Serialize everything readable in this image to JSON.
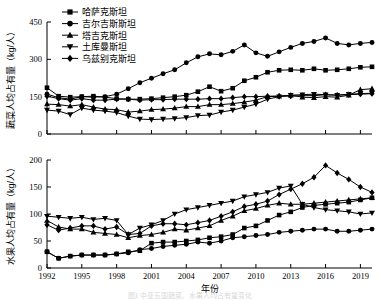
{
  "figure": {
    "caption": "图1  中亚五国蔬菜、水果人均占有量变化"
  },
  "legend": {
    "position": "top-left-inside",
    "items": [
      {
        "label": "哈萨克斯坦",
        "marker": "square"
      },
      {
        "label": "吉尔吉斯斯坦",
        "marker": "circle"
      },
      {
        "label": "塔吉克斯坦",
        "marker": "triangle-up"
      },
      {
        "label": "土库曼斯坦",
        "marker": "triangle-down"
      },
      {
        "label": "乌兹别克斯坦",
        "marker": "diamond"
      }
    ]
  },
  "chart_data": [
    {
      "type": "line",
      "panel": "top",
      "title": "",
      "xlabel": "",
      "ylabel": "蔬菜人均占有量（kg/人）",
      "xlim": [
        1992,
        2020
      ],
      "ylim": [
        0,
        450
      ],
      "yticks": [
        0,
        150,
        300,
        450
      ],
      "xticks": [
        1992,
        1995,
        1998,
        2001,
        2004,
        2007,
        2010,
        2013,
        2016,
        2019
      ],
      "xticklabels": [
        "",
        "",
        "",
        "",
        "",
        "",
        "",
        "",
        "",
        ""
      ],
      "grid": false,
      "x": [
        1992,
        1993,
        1994,
        1995,
        1996,
        1997,
        1998,
        1999,
        2000,
        2001,
        2002,
        2003,
        2004,
        2005,
        2006,
        2007,
        2008,
        2009,
        2010,
        2011,
        2012,
        2013,
        2014,
        2015,
        2016,
        2017,
        2018,
        2019,
        2020
      ],
      "series": [
        {
          "name": "哈萨克斯坦",
          "marker": "square",
          "values": [
            186,
            152,
            148,
            150,
            152,
            148,
            142,
            140,
            140,
            142,
            146,
            150,
            156,
            170,
            190,
            172,
            184,
            214,
            228,
            248,
            256,
            258,
            256,
            262,
            256,
            258,
            262,
            268,
            270
          ]
        },
        {
          "name": "吉尔吉斯斯坦",
          "marker": "circle",
          "values": [
            160,
            146,
            140,
            150,
            148,
            150,
            160,
            182,
            206,
            224,
            242,
            258,
            286,
            310,
            322,
            318,
            332,
            358,
            326,
            312,
            330,
            348,
            364,
            372,
            386,
            364,
            358,
            364,
            368
          ]
        },
        {
          "name": "塔吉克斯坦",
          "marker": "triangle-up",
          "values": [
            120,
            118,
            112,
            118,
            108,
            100,
            98,
            88,
            92,
            98,
            100,
            104,
            110,
            110,
            118,
            118,
            122,
            128,
            136,
            150,
            152,
            156,
            148,
            146,
            150,
            148,
            156,
            178,
            182
          ]
        },
        {
          "name": "土库曼斯坦",
          "marker": "triangle-down",
          "values": [
            96,
            92,
            78,
            104,
            96,
            92,
            86,
            72,
            60,
            58,
            60,
            62,
            66,
            74,
            76,
            88,
            96,
            108,
            120,
            140,
            150,
            156,
            158,
            160,
            158,
            156,
            160,
            162,
            164
          ]
        },
        {
          "name": "乌兹别克斯坦",
          "marker": "diamond",
          "values": [
            152,
            142,
            136,
            142,
            136,
            136,
            140,
            140,
            136,
            138,
            138,
            140,
            140,
            140,
            142,
            142,
            146,
            150,
            150,
            152,
            152,
            152,
            154,
            154,
            158,
            156,
            158,
            160,
            162
          ]
        }
      ]
    },
    {
      "type": "line",
      "panel": "bottom",
      "title": "",
      "xlabel": "年份",
      "ylabel": "水果人均占有量（kg/人）",
      "xlim": [
        1992,
        2020
      ],
      "ylim": [
        0,
        200
      ],
      "yticks": [
        0,
        50,
        100,
        150,
        200
      ],
      "xticks": [
        1992,
        1995,
        1998,
        2001,
        2004,
        2007,
        2010,
        2013,
        2016,
        2019
      ],
      "xticklabels": [
        "1992",
        "1995",
        "1998",
        "2001",
        "2004",
        "2007",
        "2010",
        "2013",
        "2016",
        "2019"
      ],
      "grid": false,
      "x": [
        1992,
        1993,
        1994,
        1995,
        1996,
        1997,
        1998,
        1999,
        2000,
        2001,
        2002,
        2003,
        2004,
        2005,
        2006,
        2007,
        2008,
        2009,
        2010,
        2011,
        2012,
        2013,
        2014,
        2015,
        2016,
        2017,
        2018,
        2019,
        2020
      ],
      "series": [
        {
          "name": "哈萨克斯坦",
          "marker": "square",
          "values": [
            30,
            18,
            22,
            24,
            24,
            24,
            26,
            30,
            32,
            46,
            48,
            48,
            50,
            52,
            56,
            58,
            62,
            74,
            78,
            88,
            98,
            104,
            112,
            116,
            118,
            120,
            122,
            126,
            130
          ]
        },
        {
          "name": "吉尔吉斯斯坦",
          "marker": "circle",
          "values": [
            30,
            18,
            22,
            24,
            24,
            24,
            26,
            28,
            34,
            36,
            40,
            42,
            44,
            48,
            46,
            50,
            56,
            58,
            60,
            62,
            66,
            68,
            70,
            72,
            72,
            68,
            68,
            70,
            72
          ]
        },
        {
          "name": "塔吉克斯坦",
          "marker": "triangle-up",
          "values": [
            88,
            76,
            72,
            72,
            66,
            64,
            62,
            56,
            60,
            62,
            66,
            72,
            70,
            74,
            78,
            88,
            96,
            106,
            110,
            116,
            120,
            118,
            118,
            120,
            122,
            124,
            126,
            128,
            130
          ]
        },
        {
          "name": "土库曼斯坦",
          "marker": "triangle-down",
          "values": [
            96,
            94,
            92,
            94,
            90,
            92,
            88,
            62,
            74,
            80,
            88,
            100,
            108,
            112,
            116,
            120,
            124,
            132,
            136,
            140,
            148,
            152,
            118,
            112,
            108,
            106,
            104,
            100,
            102
          ]
        },
        {
          "name": "乌兹别克斯坦",
          "marker": "diamond",
          "values": [
            80,
            70,
            74,
            78,
            78,
            72,
            76,
            62,
            64,
            78,
            82,
            82,
            80,
            84,
            88,
            96,
            104,
            114,
            118,
            124,
            136,
            146,
            156,
            168,
            190,
            176,
            164,
            150,
            140
          ]
        }
      ]
    }
  ]
}
